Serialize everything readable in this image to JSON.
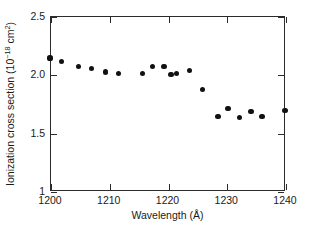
{
  "chart_data": {
    "type": "scatter",
    "title": "",
    "xlabel": "Wavelength (Å)",
    "ylabel_text": "Ionization cross section (10",
    "ylabel_exp": "−18",
    "ylabel_tail": " cm",
    "ylabel_exp2": "2",
    "ylabel_close": ")",
    "ylabel_full": "Ionization cross section (10−18 cm2)",
    "xlim": [
      1200,
      1240
    ],
    "ylim": [
      1.0,
      2.5
    ],
    "grid": false,
    "legend": null,
    "xticks": [
      1200,
      1210,
      1220,
      1230,
      1240
    ],
    "xticklabels": [
      "1200",
      "1210",
      "1220",
      "1230",
      "1240"
    ],
    "yticks": [
      1.0,
      1.5,
      2.0,
      2.5
    ],
    "yticklabels": [
      "1",
      "1.5",
      "2.0",
      "2.5"
    ],
    "marker": "filled-circle",
    "marker_color": "#111111",
    "x": [
      1200.0,
      1202.0,
      1204.8,
      1207.1,
      1209.5,
      1211.6,
      1215.8,
      1217.5,
      1219.4,
      1220.6,
      1221.6,
      1223.7,
      1225.9,
      1228.6,
      1230.3,
      1232.2,
      1234.2,
      1236.1,
      1240.0
    ],
    "y": [
      2.14,
      2.11,
      2.07,
      2.05,
      2.02,
      2.01,
      2.01,
      2.07,
      2.07,
      2.0,
      2.01,
      2.03,
      1.87,
      1.64,
      1.71,
      1.63,
      1.68,
      1.64,
      1.69
    ]
  }
}
